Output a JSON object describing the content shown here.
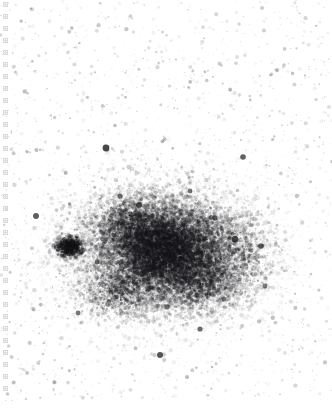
{
  "figure": {
    "width": 332,
    "height": 414,
    "background_color": "#ffffff",
    "title": ""
  },
  "tick_rail": {
    "name": "left-tick-rail",
    "axis": "y",
    "x_position": 3,
    "start_y": 2,
    "end_y": 395,
    "spacing": 12,
    "glyph_size": 5,
    "glyph_shape": "small-square-crosshair",
    "color": "#d8d8de",
    "count": 33,
    "labels": []
  },
  "chart_data": {
    "type": "scatter",
    "title": "",
    "subtitle": "",
    "xlabel": "",
    "ylabel": "",
    "xlim": [
      0,
      332
    ],
    "ylim": [
      414,
      0
    ],
    "grid": false,
    "legend": null,
    "legend_position": "none",
    "point_color": "#202024",
    "marker": "dot",
    "components": [
      {
        "name": "sparse-background-field",
        "role": "halo",
        "n_points": 2200,
        "distribution": "uniform",
        "x_range": [
          0,
          332
        ],
        "y_range": [
          0,
          400
        ],
        "size_range": [
          0.5,
          2.2
        ],
        "opacity_range": [
          0.04,
          0.3
        ],
        "color": "#202024"
      },
      {
        "name": "outer-cluster-halo",
        "role": "halo",
        "n_points": 5200,
        "distribution": "gaussian",
        "center": [
          155,
          251
        ],
        "sigma": [
          58,
          42
        ],
        "size_range": [
          0.5,
          2.4
        ],
        "opacity_range": [
          0.05,
          0.45
        ],
        "color": "#202024"
      },
      {
        "name": "cluster-core",
        "role": "core",
        "n_points": 10500,
        "distribution": "gaussian",
        "center": [
          163,
          250
        ],
        "sigma": [
          40,
          28
        ],
        "size_range": [
          0.6,
          2.6
        ],
        "opacity_range": [
          0.1,
          0.62
        ],
        "color": "#1c1c20"
      },
      {
        "name": "cluster-inner-core",
        "role": "core",
        "n_points": 5200,
        "distribution": "gaussian",
        "center": [
          166,
          248
        ],
        "sigma": [
          28,
          20
        ],
        "size_range": [
          0.6,
          2.3
        ],
        "opacity_range": [
          0.14,
          0.7
        ],
        "color": "#18181c"
      },
      {
        "name": "lower-right-condensation",
        "role": "core",
        "n_points": 2300,
        "distribution": "gaussian",
        "center": [
          198,
          281
        ],
        "sigma": [
          26,
          18
        ],
        "size_range": [
          0.6,
          2.4
        ],
        "opacity_range": [
          0.12,
          0.6
        ],
        "color": "#1a1a1e"
      },
      {
        "name": "upper-left-condensation",
        "role": "core",
        "n_points": 1700,
        "distribution": "gaussian",
        "center": [
          130,
          224
        ],
        "sigma": [
          22,
          16
        ],
        "size_range": [
          0.6,
          2.3
        ],
        "opacity_range": [
          0.12,
          0.58
        ],
        "color": "#1a1a1e"
      },
      {
        "name": "lower-left-condensation",
        "role": "core",
        "n_points": 1500,
        "distribution": "gaussian",
        "center": [
          120,
          292
        ],
        "sigma": [
          22,
          15
        ],
        "size_range": [
          0.6,
          2.3
        ],
        "opacity_range": [
          0.1,
          0.55
        ],
        "color": "#1a1a1e"
      },
      {
        "name": "right-extension",
        "role": "halo",
        "n_points": 1600,
        "distribution": "gaussian",
        "center": [
          235,
          255
        ],
        "sigma": [
          24,
          26
        ],
        "size_range": [
          0.6,
          2.4
        ],
        "opacity_range": [
          0.08,
          0.52
        ],
        "color": "#1c1c20"
      },
      {
        "name": "detached-dark-blob",
        "role": "blob",
        "n_points": 700,
        "distribution": "gaussian",
        "center": [
          70,
          247
        ],
        "sigma": [
          8,
          6
        ],
        "size_range": [
          0.8,
          2.6
        ],
        "opacity_range": [
          0.25,
          0.85
        ],
        "color": "#141418"
      }
    ],
    "bright_points": [
      {
        "x": 106,
        "y": 148,
        "size": 3.4,
        "opacity": 0.82
      },
      {
        "x": 139,
        "y": 205,
        "size": 3.0,
        "opacity": 0.78
      },
      {
        "x": 243,
        "y": 157,
        "size": 2.8,
        "opacity": 0.7
      },
      {
        "x": 160,
        "y": 355,
        "size": 3.0,
        "opacity": 0.76
      },
      {
        "x": 200,
        "y": 329,
        "size": 2.6,
        "opacity": 0.66
      },
      {
        "x": 36,
        "y": 216,
        "size": 3.0,
        "opacity": 0.72
      },
      {
        "x": 235,
        "y": 239,
        "size": 3.2,
        "opacity": 0.8
      },
      {
        "x": 261,
        "y": 246,
        "size": 2.8,
        "opacity": 0.72
      },
      {
        "x": 215,
        "y": 218,
        "size": 2.6,
        "opacity": 0.68
      },
      {
        "x": 120,
        "y": 196,
        "size": 2.6,
        "opacity": 0.66
      },
      {
        "x": 78,
        "y": 313,
        "size": 2.4,
        "opacity": 0.6
      },
      {
        "x": 190,
        "y": 191,
        "size": 2.4,
        "opacity": 0.62
      },
      {
        "x": 167,
        "y": 307,
        "size": 2.6,
        "opacity": 0.64
      },
      {
        "x": 265,
        "y": 286,
        "size": 2.4,
        "opacity": 0.58
      },
      {
        "x": 97,
        "y": 262,
        "size": 2.4,
        "opacity": 0.6
      },
      {
        "x": 144,
        "y": 271,
        "size": 2.4,
        "opacity": 0.62
      },
      {
        "x": 224,
        "y": 299,
        "size": 2.4,
        "opacity": 0.58
      },
      {
        "x": 186,
        "y": 246,
        "size": 2.4,
        "opacity": 0.6
      }
    ]
  }
}
